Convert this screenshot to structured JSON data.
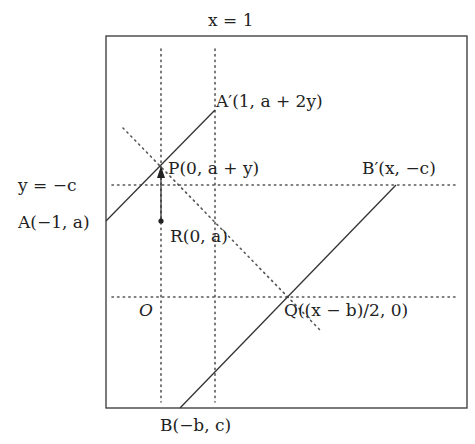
{
  "diagram": {
    "labels": {
      "x_eq_1": "x = 1",
      "y_eq_neg_c": "y = −c",
      "A": "A(−1, a)",
      "A_prime": "A′(1, a + 2y)",
      "P": "P(0, a + y)",
      "R": "R(0, a)",
      "B_prime": "B′(x, −c)",
      "Q": "Q((x − b)/2, 0)",
      "O": "O",
      "B": "B(−b, c)"
    },
    "points": {
      "A": [
        -1,
        "a"
      ],
      "A_prime": [
        1,
        "a + 2y"
      ],
      "P": [
        0,
        "a + y"
      ],
      "R": [
        0,
        "a"
      ],
      "B_prime": [
        "x",
        "-c"
      ],
      "Q": [
        "(x - b)/2",
        0
      ],
      "O": [
        0,
        0
      ],
      "B": [
        "-b",
        "c"
      ]
    },
    "segments": [
      {
        "from": "A",
        "to": "A_prime",
        "style": "solid"
      },
      {
        "from": "B",
        "to": "B_prime",
        "style": "solid"
      },
      {
        "from": "R",
        "to": "P",
        "style": "arrow"
      }
    ],
    "reference_lines": [
      {
        "name": "x = 0",
        "style": "dotted",
        "orientation": "vertical"
      },
      {
        "name": "x = 1",
        "style": "dotted",
        "orientation": "vertical"
      },
      {
        "name": "y = -c",
        "style": "dotted",
        "orientation": "horizontal"
      },
      {
        "name": "y = 0",
        "style": "dotted",
        "orientation": "horizontal"
      },
      {
        "name": "diagonal through P and Q",
        "style": "dotted",
        "orientation": "diagonal"
      }
    ]
  }
}
